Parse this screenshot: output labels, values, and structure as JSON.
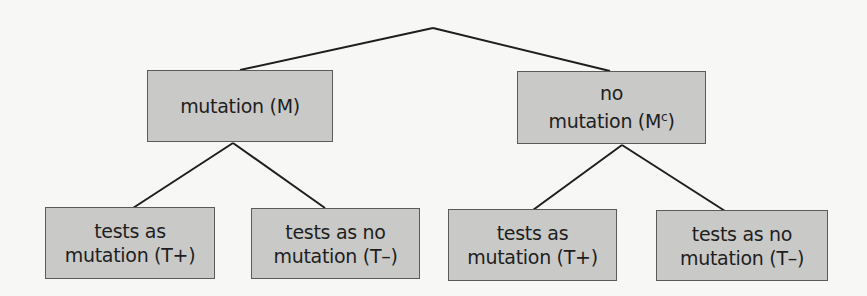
{
  "diagram": {
    "type": "tree",
    "colors": {
      "node_fill": "#c9c9c7",
      "node_border": "#5a5a5a",
      "edge": "#1e1e1e",
      "background": "#f7f7f5"
    },
    "root": {
      "x": 433,
      "y": 28
    },
    "level1": [
      {
        "id": "M",
        "label_line1": "mutation (M)",
        "label_line2": ""
      },
      {
        "id": "Mc",
        "label_line1": "no",
        "label_line2_main": "mutation (M",
        "label_line2_sup": "c",
        "label_line2_end": ")"
      }
    ],
    "level2": [
      {
        "parent": "M",
        "line1": "tests as",
        "line2": "mutation (T+)"
      },
      {
        "parent": "M",
        "line1": "tests as no",
        "line2": "mutation (T–)"
      },
      {
        "parent": "Mc",
        "line1": "tests as",
        "line2": "mutation (T+)"
      },
      {
        "parent": "Mc",
        "line1": "tests as no",
        "line2": "mutation (T–)"
      }
    ]
  }
}
